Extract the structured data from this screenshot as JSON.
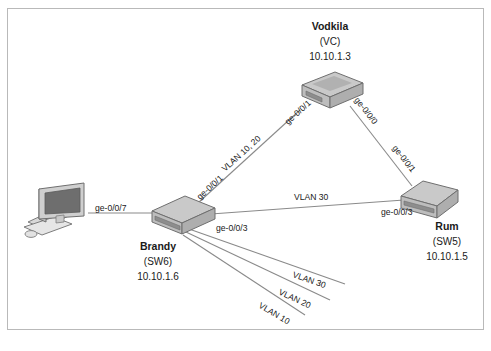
{
  "figure": {
    "type": "network-topology-diagram",
    "background": "#ffffff",
    "border_color": "#b9b9b9"
  },
  "nodes": [
    {
      "id": "vodkila",
      "name": "Vodkila",
      "alias": "(VC)",
      "ip": "10.10.1.3",
      "device_type": "switch",
      "label_position": "above"
    },
    {
      "id": "brandy",
      "name": "Brandy",
      "alias": "(SW6)",
      "ip": "10.10.1.6",
      "device_type": "switch",
      "label_position": "below"
    },
    {
      "id": "rum",
      "name": "Rum",
      "alias": "(SW5)",
      "ip": "10.10.1.5",
      "device_type": "switch",
      "label_position": "below"
    },
    {
      "id": "workstation",
      "name": "",
      "alias": "",
      "ip": "",
      "device_type": "pc",
      "label_position": "none"
    }
  ],
  "links": [
    {
      "id": "pc-brandy",
      "from": "workstation",
      "to": "brandy",
      "from_port": "",
      "to_port": "ge-0/0/7",
      "vlan_label": ""
    },
    {
      "id": "brandy-vodkila",
      "from": "brandy",
      "to": "vodkila",
      "from_port": "ge-0/0/1",
      "to_port": "ge-0/0/1",
      "vlan_label": "VLAN 10, 20"
    },
    {
      "id": "vodkila-rum",
      "from": "vodkila",
      "to": "rum",
      "from_port": "ge-0/0/0",
      "to_port": "ge-0/0/1",
      "vlan_label": ""
    },
    {
      "id": "brandy-rum",
      "from": "brandy",
      "to": "rum",
      "from_port": "ge-0/0/3",
      "to_port": "ge-0/0/3",
      "vlan_label": "VLAN 30"
    }
  ],
  "trailing_vlans": [
    {
      "id": "trail-vlan-30",
      "label": "VLAN 30"
    },
    {
      "id": "trail-vlan-20",
      "label": "VLAN 20"
    },
    {
      "id": "trail-vlan-10",
      "label": "VLAN 10"
    }
  ],
  "colors": {
    "device_top": "#c9c9c9",
    "device_side": "#b0b0b0",
    "device_front": "#bdbdbd",
    "device_stroke": "#6f6f6f",
    "link_line": "#8a8a8a",
    "screen": "#6e6e6e",
    "text": "#1a1a1a"
  }
}
